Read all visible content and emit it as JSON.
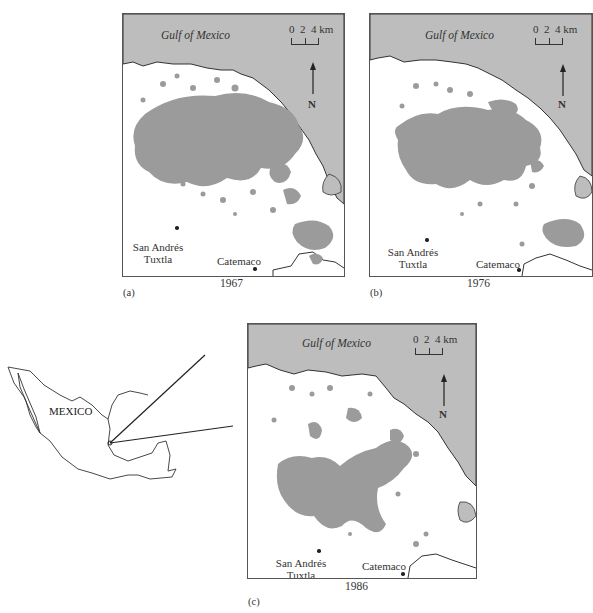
{
  "figure": {
    "panels": [
      {
        "id": "a",
        "label": "(a)",
        "year": "1967",
        "sea_label": "Gulf of Mexico",
        "scale": {
          "ticks": [
            "0",
            "2",
            "4"
          ],
          "unit": "km"
        },
        "north_label": "N",
        "cities": [
          {
            "name_line1": "San Andrés",
            "name_line2": "Tuxtla"
          },
          {
            "name_line1": "Catemaco",
            "name_line2": ""
          }
        ],
        "forest_extent": "large"
      },
      {
        "id": "b",
        "label": "(b)",
        "year": "1976",
        "sea_label": "Gulf of Mexico",
        "scale": {
          "ticks": [
            "0",
            "2",
            "4"
          ],
          "unit": "km"
        },
        "north_label": "N",
        "cities": [
          {
            "name_line1": "San Andrés",
            "name_line2": "Tuxtla"
          },
          {
            "name_line1": "Catemaco",
            "name_line2": ""
          }
        ],
        "forest_extent": "medium"
      },
      {
        "id": "c",
        "label": "(c)",
        "year": "1986",
        "sea_label": "Gulf of Mexico",
        "scale": {
          "ticks": [
            "0",
            "2",
            "4"
          ],
          "unit": "km"
        },
        "north_label": "N",
        "cities": [
          {
            "name_line1": "San Andrés",
            "name_line2": "Tuxtla"
          },
          {
            "name_line1": "Catemaco",
            "name_line2": ""
          }
        ],
        "forest_extent": "small"
      }
    ],
    "inset": {
      "country_label": "MEXICO"
    },
    "colors": {
      "sea": "#bdbdbd",
      "forest": "#9b9b9b",
      "land": "#ffffff",
      "outline": "#444444"
    }
  }
}
